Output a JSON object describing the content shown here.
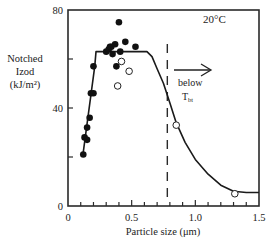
{
  "chart_data": {
    "type": "scatter",
    "title": "",
    "annotation_temp": "20°C",
    "annotation_arrow_text_1": "below",
    "annotation_arrow_text_2": "T",
    "annotation_arrow_sub": "bt",
    "xlabel": "Particle size (μm)",
    "ylabel_lines": [
      "Notched",
      "Izod",
      "(kJ/m²)"
    ],
    "xlim": [
      0,
      1.5
    ],
    "ylim": [
      0,
      80
    ],
    "x_ticks_major": [
      0,
      0.5,
      1.0,
      1.5
    ],
    "x_tick_labels": [
      "0",
      "0.5",
      "1.0",
      "1.5"
    ],
    "x_ticks_minor_step": 0.1,
    "y_ticks_major": [
      0,
      40,
      80
    ],
    "y_tick_labels": [
      "0",
      "40",
      "80"
    ],
    "y_ticks_minor_step": 20,
    "grid": false,
    "legend": null,
    "dashed_vline_x": 0.78,
    "series": [
      {
        "name": "closed points",
        "marker": "filled-circle",
        "points": [
          [
            0.12,
            21
          ],
          [
            0.13,
            28
          ],
          [
            0.15,
            27
          ],
          [
            0.15,
            32
          ],
          [
            0.17,
            36
          ],
          [
            0.18,
            46
          ],
          [
            0.2,
            46
          ],
          [
            0.2,
            57
          ],
          [
            0.3,
            63
          ],
          [
            0.32,
            64
          ],
          [
            0.33,
            65
          ],
          [
            0.34,
            65
          ],
          [
            0.35,
            62
          ],
          [
            0.37,
            66
          ],
          [
            0.38,
            57
          ],
          [
            0.41,
            63
          ],
          [
            0.4,
            75
          ],
          [
            0.45,
            67
          ],
          [
            0.53,
            65
          ]
        ]
      },
      {
        "name": "open points",
        "marker": "open-circle",
        "points": [
          [
            0.42,
            59
          ],
          [
            0.48,
            55
          ],
          [
            0.39,
            49
          ],
          [
            0.85,
            33
          ],
          [
            1.31,
            5
          ]
        ]
      },
      {
        "name": "trend line",
        "marker": "line",
        "points": [
          [
            0.12,
            22
          ],
          [
            0.21,
            57
          ],
          [
            0.22,
            63
          ],
          [
            0.62,
            63
          ],
          [
            0.66,
            61
          ],
          [
            0.7,
            56
          ],
          [
            0.75,
            50
          ],
          [
            0.8,
            42
          ],
          [
            0.85,
            34
          ],
          [
            0.92,
            26
          ],
          [
            1.0,
            19
          ],
          [
            1.1,
            13
          ],
          [
            1.2,
            8.5
          ],
          [
            1.3,
            6
          ],
          [
            1.4,
            5.5
          ],
          [
            1.5,
            5.5
          ]
        ]
      }
    ]
  }
}
